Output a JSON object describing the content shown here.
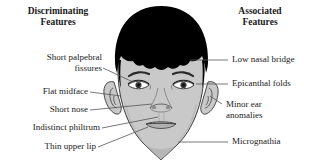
{
  "figure": {
    "headings": {
      "left": {
        "line1": "Discriminating",
        "line2": "Features"
      },
      "right": {
        "line1": "Associated",
        "line2": "Features"
      }
    },
    "left_labels": [
      {
        "id": "short-palpebral-fissures",
        "line1": "Short palpebral",
        "line2": "fissures"
      },
      {
        "id": "flat-midface",
        "line1": "Flat midface",
        "line2": ""
      },
      {
        "id": "short-nose",
        "line1": "Short nose",
        "line2": ""
      },
      {
        "id": "indistinct-philtrum",
        "line1": "Indistinct philtrum",
        "line2": ""
      },
      {
        "id": "thin-upper-lip",
        "line1": "Thin upper lip",
        "line2": ""
      }
    ],
    "right_labels": [
      {
        "id": "low-nasal-bridge",
        "line1": "Low nasal bridge",
        "line2": ""
      },
      {
        "id": "epicanthal-folds",
        "line1": "Epicanthal folds",
        "line2": ""
      },
      {
        "id": "minor-ear-anomalies",
        "line1": "Minor ear",
        "line2": "anomalies"
      },
      {
        "id": "micrognathia",
        "line1": "Micrognathia",
        "line2": ""
      }
    ],
    "colors": {
      "hair": "#000000",
      "skin": "#c9c9c9",
      "skin_shadow": "#a8a8a8",
      "outline": "#3a3a3a",
      "leader": "#555555",
      "text": "#1a1a1a",
      "background": "#ffffff"
    }
  }
}
